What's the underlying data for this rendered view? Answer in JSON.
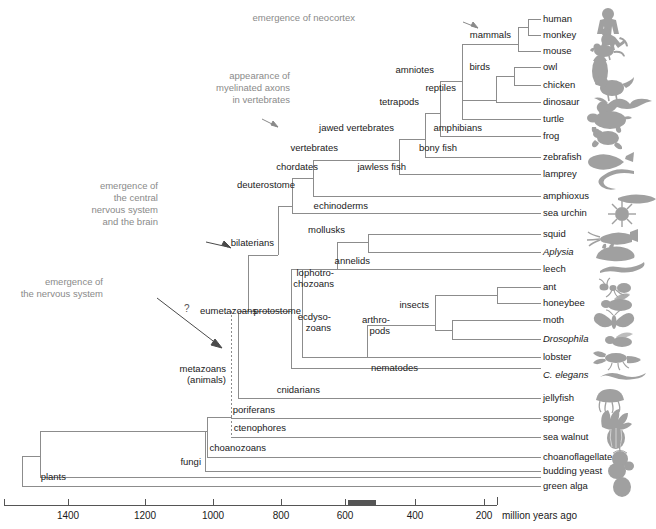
{
  "colors": {
    "branch": "#8c8c8c",
    "text": "#1a1a1a",
    "annotation": "#8a8a8a",
    "silhouette": "#9e9e9e",
    "cambrian_bar": "#555555",
    "axis": "#555555"
  },
  "leaves": [
    {
      "label": "human",
      "y": 19,
      "x": 543,
      "italic": false,
      "icon": "human-silhouette"
    },
    {
      "label": "monkey",
      "y": 35,
      "x": 543,
      "italic": false,
      "icon": "monkey-silhouette"
    },
    {
      "label": "mouse",
      "y": 51,
      "x": 543,
      "italic": false,
      "icon": "mouse-silhouette"
    },
    {
      "label": "owl",
      "y": 67,
      "x": 543,
      "italic": false,
      "icon": "owl-silhouette"
    },
    {
      "label": "chicken",
      "y": 85,
      "x": 543,
      "italic": false,
      "icon": "chicken-silhouette"
    },
    {
      "label": "dinosaur",
      "y": 102,
      "x": 543,
      "italic": false,
      "icon": "dinosaur-silhouette"
    },
    {
      "label": "turtle",
      "y": 119,
      "x": 543,
      "italic": false,
      "icon": "turtle-silhouette"
    },
    {
      "label": "frog",
      "y": 136,
      "x": 543,
      "italic": false,
      "icon": "frog-silhouette"
    },
    {
      "label": "zebrafish",
      "y": 157,
      "x": 543,
      "italic": false,
      "icon": "zebrafish-silhouette"
    },
    {
      "label": "lamprey",
      "y": 174,
      "x": 543,
      "italic": false,
      "icon": "lamprey-silhouette"
    },
    {
      "label": "amphioxus",
      "y": 196,
      "x": 543,
      "italic": false,
      "icon": "amphioxus-silhouette"
    },
    {
      "label": "sea urchin",
      "y": 213,
      "x": 543,
      "italic": false,
      "icon": "sea-urchin-silhouette"
    },
    {
      "label": "squid",
      "y": 234,
      "x": 543,
      "italic": false,
      "icon": "squid-silhouette"
    },
    {
      "label": "Aplysia",
      "y": 252,
      "x": 543,
      "italic": true,
      "icon": "aplysia-silhouette"
    },
    {
      "label": "leech",
      "y": 269,
      "x": 543,
      "italic": false,
      "icon": "leech-silhouette"
    },
    {
      "label": "ant",
      "y": 287,
      "x": 543,
      "italic": false,
      "icon": "ant-silhouette"
    },
    {
      "label": "honeybee",
      "y": 303,
      "x": 543,
      "italic": false,
      "icon": "honeybee-silhouette"
    },
    {
      "label": "moth",
      "y": 320,
      "x": 543,
      "italic": false,
      "icon": "moth-silhouette"
    },
    {
      "label": "Drosophila",
      "y": 339,
      "x": 543,
      "italic": true,
      "icon": "drosophila-silhouette"
    },
    {
      "label": "lobster",
      "y": 357,
      "x": 543,
      "italic": false,
      "icon": "lobster-silhouette"
    },
    {
      "label": "C. elegans",
      "y": 375,
      "x": 543,
      "italic": true,
      "icon": "c-elegans-silhouette"
    },
    {
      "label": "jellyfish",
      "y": 398,
      "x": 543,
      "italic": false,
      "icon": "jellyfish-silhouette"
    },
    {
      "label": "sponge",
      "y": 418,
      "x": 543,
      "italic": false,
      "icon": "sponge-silhouette"
    },
    {
      "label": "sea walnut",
      "y": 437,
      "x": 543,
      "italic": false,
      "icon": "sea-walnut-silhouette"
    },
    {
      "label": "choanoflagellate",
      "y": 457,
      "x": 543,
      "italic": false,
      "icon": "choanoflagellate-silhouette"
    },
    {
      "label": "budding yeast",
      "y": 471,
      "x": 543,
      "italic": false,
      "icon": "budding-yeast-silhouette"
    },
    {
      "label": "green alga",
      "y": 486,
      "x": 543,
      "italic": false,
      "icon": "green-alga-silhouette"
    }
  ],
  "internal_nodes": [
    {
      "label": "mammals",
      "x": 513,
      "y": 35,
      "align": "right"
    },
    {
      "label": "birds",
      "x": 492,
      "y": 67,
      "align": "right"
    },
    {
      "label": "reptiles",
      "x": 458,
      "y": 88,
      "align": "right"
    },
    {
      "label": "amniotes",
      "x": 436,
      "y": 70,
      "align": "right"
    },
    {
      "label": "tetrapods",
      "x": 421,
      "y": 102,
      "align": "right"
    },
    {
      "label": "amphibians",
      "x": 484,
      "y": 128,
      "align": "right"
    },
    {
      "label": "bony fish",
      "x": 459,
      "y": 148,
      "align": "right"
    },
    {
      "label": "jawed vertebrates",
      "x": 396,
      "y": 128,
      "align": "right"
    },
    {
      "label": "jawless fish",
      "x": 408,
      "y": 167,
      "align": "right"
    },
    {
      "label": "vertebrates",
      "x": 340,
      "y": 148,
      "align": "right"
    },
    {
      "label": "chordates",
      "x": 320,
      "y": 167,
      "align": "right"
    },
    {
      "label": "deuterostome",
      "x": 297,
      "y": 185,
      "align": "right"
    },
    {
      "label": "echinoderms",
      "x": 370,
      "y": 206,
      "align": "right"
    },
    {
      "label": "mollusks",
      "x": 347,
      "y": 230,
      "align": "right"
    },
    {
      "label": "annelids",
      "x": 372,
      "y": 261,
      "align": "right"
    },
    {
      "label": "bilaterians",
      "x": 276,
      "y": 243,
      "align": "right"
    },
    {
      "label": "lophotro-\nchozoans",
      "x": 336,
      "y": 278,
      "align": "right"
    },
    {
      "label": "protostome",
      "x": 303,
      "y": 311,
      "align": "right"
    },
    {
      "label": "ecdyso-\nzoans",
      "x": 333,
      "y": 322,
      "align": "right"
    },
    {
      "label": "arthro-\npods",
      "x": 392,
      "y": 325,
      "align": "right"
    },
    {
      "label": "insects",
      "x": 431,
      "y": 305,
      "align": "right"
    },
    {
      "label": "nematodes",
      "x": 420,
      "y": 368,
      "align": "right"
    },
    {
      "label": "eumetazoans",
      "x": 259,
      "y": 311,
      "align": "right"
    },
    {
      "label": "cnidarians",
      "x": 322,
      "y": 390,
      "align": "right"
    },
    {
      "label": "metazoans\n(animals)",
      "x": 228,
      "y": 374,
      "align": "right"
    },
    {
      "label": "poriferans",
      "x": 277,
      "y": 410,
      "align": "right"
    },
    {
      "label": "ctenophores",
      "x": 288,
      "y": 428,
      "align": "right"
    },
    {
      "label": "choanozoans",
      "x": 268,
      "y": 448,
      "align": "right"
    },
    {
      "label": "fungi",
      "x": 203,
      "y": 462,
      "align": "right"
    },
    {
      "label": "plants",
      "x": 68,
      "y": 477,
      "align": "right"
    }
  ],
  "annotations": [
    {
      "label": "emergence of neocortex",
      "x": 355,
      "y": 18,
      "arrow": true
    },
    {
      "label": "appearance of\nmyelinated axons\nin vertebrates",
      "x": 290,
      "y": 88,
      "arrow": true
    },
    {
      "label": "emergence of\nthe central\nnervous system\nand the brain",
      "x": 158,
      "y": 204,
      "arrow": true
    },
    {
      "label": "emergence of\nthe nervous system",
      "x": 103,
      "y": 288,
      "arrow": true
    },
    {
      "label": "?",
      "x": 184,
      "y": 309,
      "arrow": false
    }
  ],
  "axis": {
    "unit_label": "million years ago",
    "unit_label_x": 502,
    "ticks": [
      {
        "value": "1400",
        "x": 68
      },
      {
        "value": "1200",
        "x": 145
      },
      {
        "value": "1000",
        "x": 213
      },
      {
        "value": "800",
        "x": 281
      },
      {
        "value": "600",
        "x": 345
      },
      {
        "value": "400",
        "x": 415
      },
      {
        "value": "200",
        "x": 484
      }
    ],
    "line_y": 505,
    "line_x1": 4,
    "line_x2": 497,
    "cambrian_bar": {
      "x1": 348,
      "x2": 375,
      "label": "Cambrian explosion"
    }
  }
}
